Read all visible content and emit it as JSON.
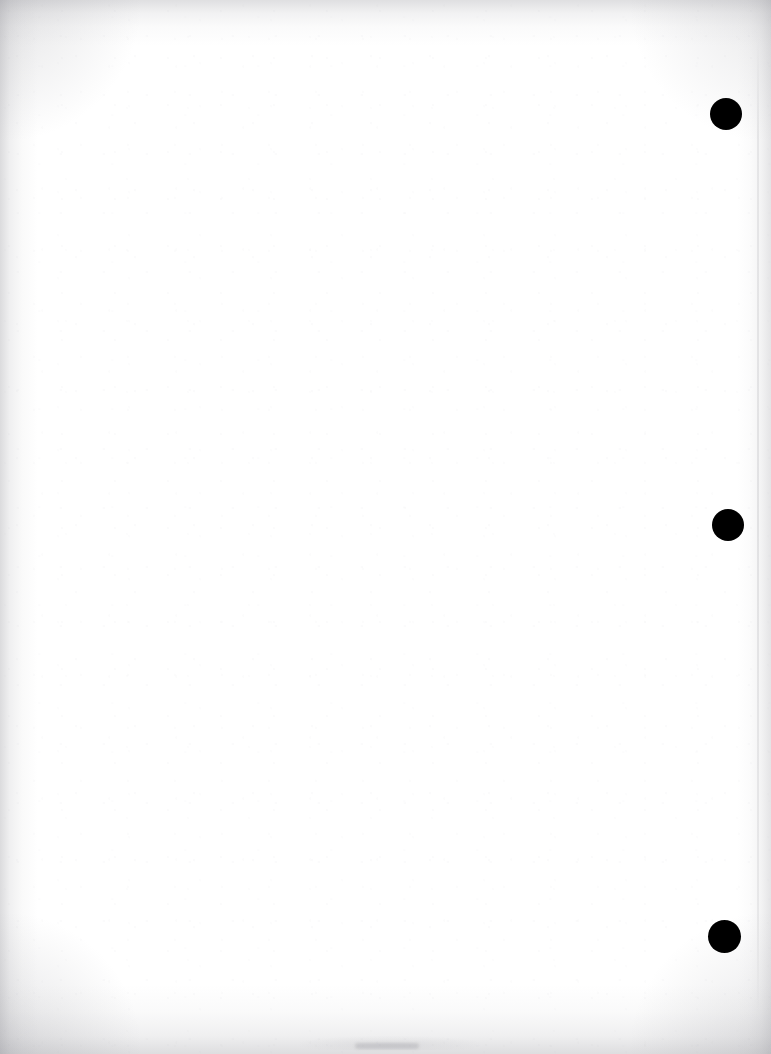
{
  "document": {
    "kind": "scanned-page",
    "page_body_text": "",
    "background_color": "#ffffff",
    "ink_color": "#000000",
    "edge_shadow_color": "#96969c",
    "width_px": 771,
    "height_px": 1054
  },
  "marks": {
    "label": "registration-marks",
    "color": "#000000",
    "items": [
      {
        "id": "mark-1",
        "shape": "filled-circle",
        "center_x": 726,
        "center_y": 114,
        "diameter": 32
      },
      {
        "id": "mark-2",
        "shape": "filled-circle",
        "center_x": 728,
        "center_y": 525,
        "diameter": 32
      },
      {
        "id": "mark-3",
        "shape": "filled-circle",
        "center_x": 724,
        "center_y": 936,
        "diameter": 33
      }
    ]
  },
  "artifacts": {
    "trim_line_right": {
      "color": "#92929 8",
      "x": 757
    },
    "bottom_smudge": {
      "color": "#96969c",
      "center_x": 387,
      "center_y": 1046
    },
    "vignette_edges": [
      "top",
      "right",
      "bottom",
      "left"
    ]
  }
}
